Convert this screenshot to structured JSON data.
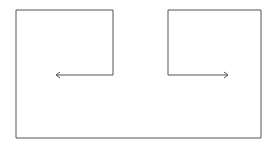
{
  "diagram": {
    "width": 276,
    "height": 147,
    "stroke_color": "#555555",
    "background": "#ffffff",
    "outline_path": "M113,75 L113,10 L16,10 L16,138 L261,138 L261,10 L168,10 L168,75",
    "left_arrow": {
      "from": [
        113,
        75
      ],
      "to": [
        56,
        75
      ],
      "direction": "left"
    },
    "right_arrow": {
      "from": [
        168,
        75
      ],
      "to": [
        228,
        75
      ],
      "direction": "right"
    }
  }
}
